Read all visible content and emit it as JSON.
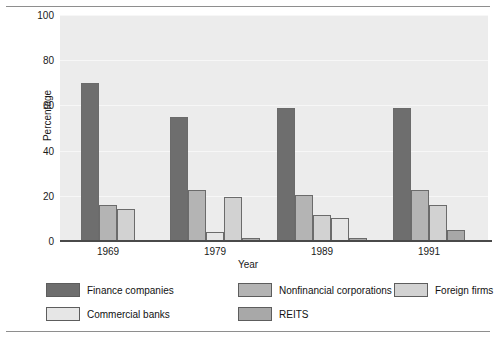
{
  "chart_data": {
    "type": "bar",
    "title": "",
    "xlabel": "Year",
    "ylabel": "Percentage",
    "categories": [
      "1969",
      "1979",
      "1989",
      "1991"
    ],
    "ylim": [
      0,
      100
    ],
    "yticks": [
      0,
      20,
      40,
      60,
      80,
      100
    ],
    "grid": true,
    "legend_position": "bottom",
    "series": [
      {
        "name": "Finance companies",
        "color": "#6e6e6e",
        "values": [
          70,
          55,
          59,
          59
        ]
      },
      {
        "name": "Nonfinancial corporations",
        "color": "#b4b4b4",
        "values": [
          16,
          22.5,
          20.5,
          22.5
        ]
      },
      {
        "name": "Foreign firms",
        "color": "#d2d2d2",
        "values": [
          14,
          19.5,
          11.5,
          16
        ]
      },
      {
        "name": "Commercial banks",
        "color": "#e6e6e6",
        "values": [
          null,
          4,
          10,
          null
        ]
      },
      {
        "name": "REITS",
        "color": "#a8a8a8",
        "values": [
          null,
          1.5,
          1.5,
          5
        ]
      }
    ],
    "groups": [
      {
        "category": "1969",
        "bars": [
          {
            "series": "Finance companies",
            "value": 70,
            "color": "#6e6e6e"
          },
          {
            "series": "Nonfinancial corporations",
            "value": 16,
            "color": "#b4b4b4"
          },
          {
            "series": "Foreign firms",
            "value": 14,
            "color": "#d2d2d2"
          }
        ]
      },
      {
        "category": "1979",
        "bars": [
          {
            "series": "Finance companies",
            "value": 55,
            "color": "#6e6e6e"
          },
          {
            "series": "Nonfinancial corporations",
            "value": 22.5,
            "color": "#b4b4b4"
          },
          {
            "series": "Commercial banks",
            "value": 4,
            "color": "#e6e6e6"
          },
          {
            "series": "Foreign firms",
            "value": 19.5,
            "color": "#d2d2d2"
          },
          {
            "series": "REITS",
            "value": 1.5,
            "color": "#a8a8a8"
          }
        ]
      },
      {
        "category": "1989",
        "bars": [
          {
            "series": "Finance companies",
            "value": 59,
            "color": "#6e6e6e"
          },
          {
            "series": "Nonfinancial corporations",
            "value": 20.5,
            "color": "#b4b4b4"
          },
          {
            "series": "Foreign firms",
            "value": 11.5,
            "color": "#d2d2d2"
          },
          {
            "series": "Commercial banks",
            "value": 10,
            "color": "#e6e6e6"
          },
          {
            "series": "REITS",
            "value": 1.5,
            "color": "#a8a8a8"
          }
        ]
      },
      {
        "category": "1991",
        "bars": [
          {
            "series": "Finance companies",
            "value": 59,
            "color": "#6e6e6e"
          },
          {
            "series": "Nonfinancial corporations",
            "value": 22.5,
            "color": "#b4b4b4"
          },
          {
            "series": "Foreign firms",
            "value": 16,
            "color": "#d2d2d2"
          },
          {
            "series": "REITS",
            "value": 5,
            "color": "#a8a8a8"
          }
        ]
      }
    ]
  },
  "axes": {
    "y_label": "Percentage",
    "x_label": "Year",
    "y_ticks": [
      "0",
      "20",
      "40",
      "60",
      "80",
      "100"
    ],
    "x_ticks": [
      "1969",
      "1979",
      "1989",
      "1991"
    ]
  },
  "legend": {
    "items": [
      {
        "label": "Finance companies",
        "color": "#6e6e6e"
      },
      {
        "label": "Nonfinancial corporations",
        "color": "#b4b4b4"
      },
      {
        "label": "Foreign firms",
        "color": "#d2d2d2"
      },
      {
        "label": "Commercial banks",
        "color": "#e6e6e6"
      },
      {
        "label": "REITS",
        "color": "#a8a8a8"
      }
    ]
  },
  "style": {
    "plot_background": "#ececec",
    "grid_color": "#f7f7f7",
    "axis_color": "#4a4a4a",
    "bar_border": "#6b6b6b",
    "rule_color": "#8e8e8e"
  }
}
